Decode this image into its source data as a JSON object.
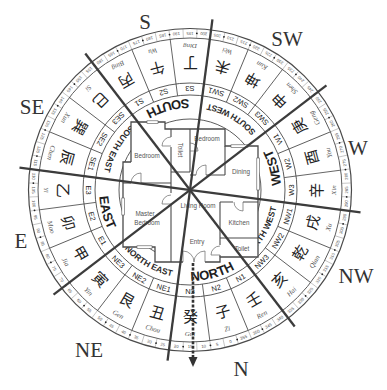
{
  "compass_points": [
    {
      "id": "S",
      "label": "S"
    },
    {
      "id": "SW",
      "label": "SW"
    },
    {
      "id": "W",
      "label": "W"
    },
    {
      "id": "NW",
      "label": "NW"
    },
    {
      "id": "N",
      "label": "N"
    },
    {
      "id": "NE",
      "label": "NE"
    },
    {
      "id": "E",
      "label": "E"
    },
    {
      "id": "SE",
      "label": "SE"
    }
  ],
  "direction_ring": [
    {
      "label": "SOUTH"
    },
    {
      "label": "SOUTH WEST"
    },
    {
      "label": "WEST"
    },
    {
      "label": "NORTH WEST"
    },
    {
      "label": "NORTH"
    },
    {
      "label": "NORTH EAST"
    },
    {
      "label": "EAST"
    },
    {
      "label": "SOUTH EAST"
    }
  ],
  "mountains": [
    {
      "code": "S1",
      "char": "丙",
      "pinyin": "Bing"
    },
    {
      "code": "S2",
      "char": "午",
      "pinyin": "Wu"
    },
    {
      "code": "S3",
      "char": "丁",
      "pinyin": "Ding"
    },
    {
      "code": "SW1",
      "char": "未",
      "pinyin": "Wei"
    },
    {
      "code": "SW2",
      "char": "坤",
      "pinyin": "Kun"
    },
    {
      "code": "SW3",
      "char": "申",
      "pinyin": "Shen"
    },
    {
      "code": "W1",
      "char": "庚",
      "pinyin": "Geng"
    },
    {
      "code": "W2",
      "char": "酉",
      "pinyin": "You"
    },
    {
      "code": "W3",
      "char": "辛",
      "pinyin": "Xin"
    },
    {
      "code": "NW1",
      "char": "戌",
      "pinyin": "Xu"
    },
    {
      "code": "NW2",
      "char": "乾",
      "pinyin": "Qian"
    },
    {
      "code": "NW3",
      "char": "亥",
      "pinyin": "Hai"
    },
    {
      "code": "N1",
      "char": "壬",
      "pinyin": "Ren"
    },
    {
      "code": "N2",
      "char": "子",
      "pinyin": "Zi"
    },
    {
      "code": "N3",
      "char": "癸",
      "pinyin": "Gui"
    },
    {
      "code": "NE1",
      "char": "丑",
      "pinyin": "Chou"
    },
    {
      "code": "NE2",
      "char": "艮",
      "pinyin": "Gen"
    },
    {
      "code": "NE3",
      "char": "寅",
      "pinyin": "Yin"
    },
    {
      "code": "E1",
      "char": "甲",
      "pinyin": "Jia"
    },
    {
      "code": "E2",
      "char": "卯",
      "pinyin": "Mao"
    },
    {
      "code": "E3",
      "char": "乙",
      "pinyin": "Yi"
    },
    {
      "code": "SE1",
      "char": "辰",
      "pinyin": "Chen"
    },
    {
      "code": "SE2",
      "char": "巽",
      "pinyin": "Xun"
    },
    {
      "code": "SE3",
      "char": "巳",
      "pinyin": "Si"
    }
  ],
  "degree_ring": {
    "labels": [
      "0",
      "5",
      "10",
      "15",
      "20",
      "25",
      "30",
      "35",
      "40",
      "45",
      "50",
      "55",
      "60",
      "65",
      "70",
      "75",
      "80",
      "85",
      "90",
      "95",
      "100",
      "105",
      "110",
      "115",
      "120",
      "125",
      "130",
      "135",
      "140",
      "145",
      "150",
      "155",
      "160",
      "165",
      "170",
      "175",
      "180",
      "185",
      "190",
      "195",
      "200",
      "205",
      "210",
      "215",
      "220",
      "225",
      "230",
      "235",
      "240",
      "245",
      "250",
      "255",
      "260",
      "265",
      "270",
      "275",
      "280",
      "285",
      "290",
      "295",
      "300",
      "305",
      "310",
      "315",
      "320",
      "325",
      "330",
      "335",
      "340",
      "345",
      "350",
      "355"
    ]
  },
  "floor_plan": {
    "rooms": {
      "bedroom_left": "Bedroom",
      "toilet_top": "Toilet",
      "bedroom_right": "Bedroom",
      "dining": "Dining",
      "living_room": "Living Room",
      "master_bedroom_line1": "Master",
      "master_bedroom_line2": "Bedroom",
      "kitchen": "Kitchen",
      "toilet_bottom": "Toilet",
      "entry": "Entry"
    }
  },
  "colors": {
    "background": "#ffffff",
    "lines": "#444444",
    "text": "#222222"
  }
}
